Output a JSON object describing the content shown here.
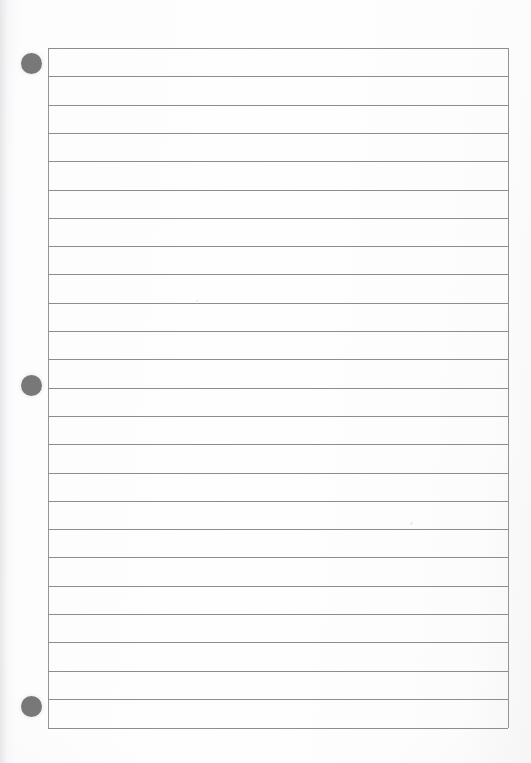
{
  "document": {
    "type": "lined-notebook-page",
    "title": "Blank ruled notebook page",
    "page_width": 531,
    "page_height": 763,
    "background_color": "#fdfdfd",
    "content_text": ""
  },
  "ruled_area": {
    "left": 48,
    "top": 48,
    "right": 508,
    "bottom": 728,
    "width": 460,
    "height": 680,
    "line_color": "#8c8c92",
    "border_color": "#94949a",
    "line_spacing": 28.3,
    "line_count": 25,
    "line_positions": [
      0,
      28.3,
      56.6,
      84.9,
      113.2,
      141.5,
      169.8,
      198.1,
      226.4,
      254.7,
      283.0,
      311.3,
      339.6,
      367.9,
      396.2,
      424.5,
      452.8,
      481.1,
      509.4,
      537.7,
      566.0,
      594.3,
      622.6,
      650.9,
      680.0
    ],
    "has_left_border": true,
    "has_right_border": true
  },
  "punch_holes": {
    "color": "#78787a",
    "diameter": 21,
    "center_x": 31,
    "items": [
      {
        "label": "top-punch-hole",
        "center_y": 63
      },
      {
        "label": "middle-punch-hole",
        "center_y": 385
      },
      {
        "label": "bottom-punch-hole",
        "center_y": 706
      }
    ]
  },
  "specks": [
    {
      "x": 410,
      "y": 522,
      "size": 3
    },
    {
      "x": 196,
      "y": 300,
      "size": 2
    }
  ]
}
